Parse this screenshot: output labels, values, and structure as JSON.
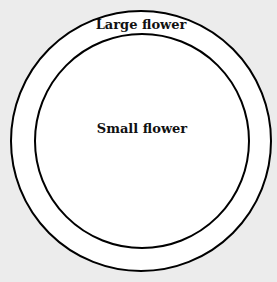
{
  "diagram": {
    "type": "nested-circles",
    "background_color": "#ececec",
    "fill_color": "#ffffff",
    "stroke_color": "#000000",
    "outer": {
      "label": "Large flower",
      "cx": 141,
      "cy": 141,
      "r": 130
    },
    "inner": {
      "label": "Small flower",
      "cx": 142,
      "cy": 141,
      "r": 107
    }
  }
}
